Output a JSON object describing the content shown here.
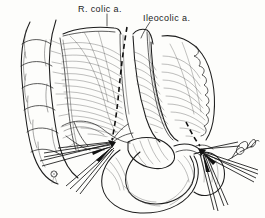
{
  "figure": {
    "background_color": "#fdfdfb",
    "ink_color": "#1b1b1b",
    "width": 265,
    "height": 218
  },
  "labels": {
    "right_colic": "R. colic a.",
    "ileocolic": "Ileocolic a."
  },
  "signature": {
    "text": "artist-signature"
  },
  "anatomy": {
    "ascending_colon": "ascending-colon",
    "mesentery_right": "right-colic-mesentery",
    "mesentery_ileocolic": "ileocolic-mesentery",
    "ileum": "terminal-ileum",
    "cecum": "cecum",
    "bowel_loop": "small-bowel-loop"
  },
  "instruments": {
    "left_clamp_group": "left-hemostat-clamps",
    "right_clamp_group": "right-hemostat-clamps",
    "ligature_knot": "ligature-knot",
    "division_line_left": "right-colic-division-line",
    "division_line_right": "ileocolic-division-line"
  }
}
